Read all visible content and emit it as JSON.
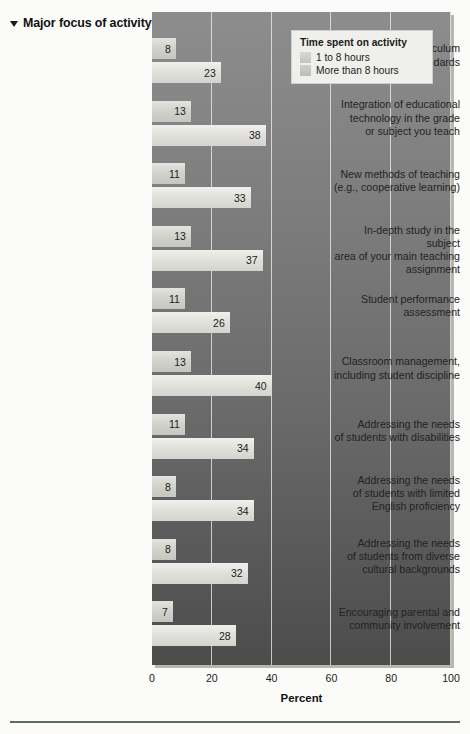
{
  "header": {
    "title": "Major focus of activity",
    "marker_icon": "triangle-down-icon"
  },
  "legend": {
    "title": "Time spent on activity",
    "items": [
      {
        "label": "1 to 8 hours",
        "color": "#d0d0ca"
      },
      {
        "label": "More than 8 hours",
        "color": "#c6c6c0"
      }
    ]
  },
  "axis": {
    "title": "Percent",
    "ticks": [
      "0",
      "20",
      "40",
      "60",
      "80",
      "100"
    ]
  },
  "chart_data": {
    "type": "bar",
    "orientation": "horizontal",
    "title": "Major focus of activity",
    "xlabel": "Percent",
    "ylabel": "",
    "xlim": [
      0,
      100
    ],
    "grid": true,
    "legend_position": "top-right",
    "legend_title": "Time spent on activity",
    "categories": [
      "State or district curriculum and performance standards",
      "Integration of educational technology in the grade or subject you teach",
      "New methods of teaching (e.g., cooperative learning)",
      "In-depth study in the subject area of your main teaching assignment",
      "Student performance assessment",
      "Classroom management, including student discipline",
      "Addressing the needs of students with disabilities",
      "Addressing the needs of students with limited English proficiency",
      "Addressing the needs of students from diverse cultural backgrounds",
      "Encouraging parental and community involvement"
    ],
    "series": [
      {
        "name": "1 to 8 hours",
        "values": [
          8,
          13,
          11,
          13,
          11,
          13,
          11,
          8,
          8,
          7
        ]
      },
      {
        "name": "More than 8 hours",
        "values": [
          23,
          38,
          33,
          37,
          26,
          40,
          34,
          34,
          32,
          28
        ]
      }
    ]
  },
  "category_label_lines": [
    [
      "State or district curriculum",
      "and performance standards"
    ],
    [
      "Integration of educational",
      "technology in the grade",
      "or subject you teach"
    ],
    [
      "New methods of teaching",
      "(e.g., cooperative learning)"
    ],
    [
      "In-depth study in the subject",
      "area of your main teaching",
      "assignment"
    ],
    [
      "Student performance",
      "assessment"
    ],
    [
      "Classroom management,",
      "including student discipline"
    ],
    [
      "Addressing the needs",
      "of students with disabilities"
    ],
    [
      "Addressing the needs",
      "of students with limited",
      "English proficiency"
    ],
    [
      "Addressing the needs",
      "of students from diverse",
      "cultural backgrounds"
    ],
    [
      "Encouraging parental and",
      "community involvement"
    ]
  ]
}
